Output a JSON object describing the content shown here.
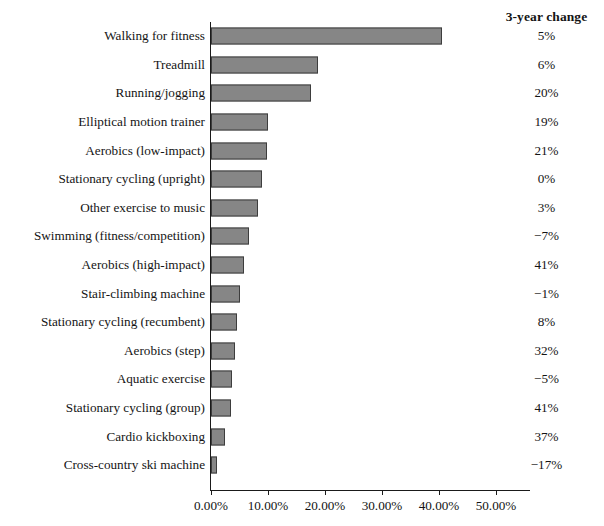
{
  "chart_data": {
    "type": "bar",
    "orientation": "horizontal",
    "title": "",
    "xlabel": "",
    "ylabel": "",
    "xlim": [
      0,
      57
    ],
    "grid": false,
    "legend": null,
    "bar_color": "#868686",
    "bar_border_color": "#3d3d3d",
    "axis_color": "#1a1a1a",
    "categories": [
      "Walking for fitness",
      "Treadmill",
      "Running/jogging",
      "Elliptical motion trainer",
      "Aerobics (low-impact)",
      "Stationary cycling (upright)",
      "Other exercise to music",
      "Swimming (fitness/competition)",
      "Aerobics (high-impact)",
      "Stair-climbing machine",
      "Stationary cycling (recumbent)",
      "Aerobics (step)",
      "Aquatic exercise",
      "Stationary cycling (group)",
      "Cardio kickboxing",
      "Cross-country ski machine"
    ],
    "values": [
      40.5,
      18.8,
      17.5,
      10.0,
      9.8,
      9.0,
      8.3,
      6.6,
      5.8,
      5.1,
      4.6,
      4.2,
      3.7,
      3.5,
      2.5,
      1.0
    ],
    "value_unit": "%",
    "annotations": {
      "column_header": "3-year change",
      "column_values": [
        "5%",
        "6%",
        "20%",
        "19%",
        "21%",
        "0%",
        "3%",
        "−7%",
        "41%",
        "−1%",
        "8%",
        "32%",
        "−5%",
        "41%",
        "37%",
        "−17%"
      ]
    },
    "xticks": [
      0,
      10,
      20,
      30,
      40,
      50
    ],
    "xticklabels": [
      "0.00%",
      "10.00%",
      "20.00%",
      "30.00%",
      "40.00%",
      "50.00%"
    ]
  }
}
